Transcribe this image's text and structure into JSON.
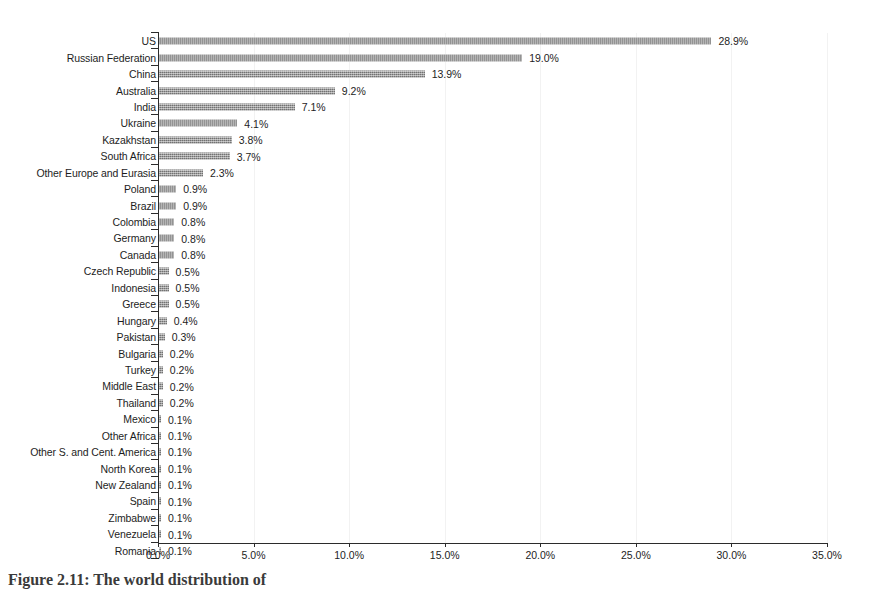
{
  "chart_data": {
    "type": "bar",
    "orientation": "horizontal",
    "title": "",
    "xlabel": "",
    "ylabel": "",
    "xlim": [
      0,
      35
    ],
    "grid": true,
    "legend": null,
    "bar_color": "#8a8a8a",
    "axis_color": "#2b2b2b",
    "value_label_suffix": "%",
    "xticks": [
      "0.0%",
      "5.0%",
      "10.0%",
      "15.0%",
      "20.0%",
      "25.0%",
      "30.0%",
      "35.0%"
    ],
    "xtick_values": [
      0,
      5,
      10,
      15,
      20,
      25,
      30,
      35
    ],
    "categories": [
      "US",
      "Russian Federation",
      "China",
      "Australia",
      "India",
      "Ukraine",
      "Kazakhstan",
      "South Africa",
      "Other Europe and Eurasia",
      "Poland",
      "Brazil",
      "Colombia",
      "Germany",
      "Canada",
      "Czech Republic",
      "Indonesia",
      "Greece",
      "Hungary",
      "Pakistan",
      "Bulgaria",
      "Turkey",
      "Middle East",
      "Thailand",
      "Mexico",
      "Other Africa",
      "Other S. and Cent. America",
      "North Korea",
      "New Zealand",
      "Spain",
      "Zimbabwe",
      "Venezuela",
      "Romania"
    ],
    "values": [
      28.9,
      19.0,
      13.9,
      9.2,
      7.1,
      4.1,
      3.8,
      3.7,
      2.3,
      0.9,
      0.9,
      0.8,
      0.8,
      0.8,
      0.5,
      0.5,
      0.5,
      0.4,
      0.3,
      0.2,
      0.2,
      0.2,
      0.2,
      0.1,
      0.1,
      0.1,
      0.1,
      0.1,
      0.1,
      0.1,
      0.1,
      0.1
    ],
    "value_labels": [
      "28.9%",
      "19.0%",
      "13.9%",
      "9.2%",
      "7.1%",
      "4.1%",
      "3.8%",
      "3.7%",
      "2.3%",
      "0.9%",
      "0.9%",
      "0.8%",
      "0.8%",
      "0.8%",
      "0.5%",
      "0.5%",
      "0.5%",
      "0.4%",
      "0.3%",
      "0.2%",
      "0.2%",
      "0.2%",
      "0.2%",
      "0.1%",
      "0.1%",
      "0.1%",
      "0.1%",
      "0.1%",
      "0.1%",
      "0.1%",
      "0.1%",
      "0.1%"
    ]
  },
  "caption": {
    "text": "Figure 2.11:  The world distribution of"
  }
}
